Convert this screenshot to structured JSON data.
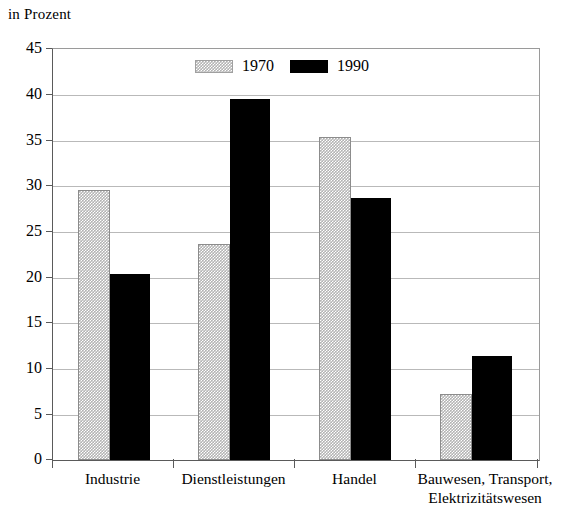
{
  "chart_data": {
    "type": "bar",
    "title": "in Prozent",
    "xlabel": "",
    "ylabel": "",
    "ylim": [
      0,
      45
    ],
    "yticks": [
      0,
      5,
      10,
      15,
      20,
      25,
      30,
      35,
      40,
      45
    ],
    "ytick_labels": [
      "0",
      "5",
      "10",
      "15",
      "20",
      "25",
      "30",
      "35",
      "40",
      "45"
    ],
    "grid": true,
    "legend_position": "top-center",
    "categories": [
      "Industrie",
      "Dienstleistungen",
      "Handel",
      "Bauwesen, Transport,\nElektrizitätswesen"
    ],
    "series": [
      {
        "name": "1970",
        "color": "#b3b3b3",
        "pattern": "checkerboard",
        "values": [
          29.6,
          23.7,
          35.4,
          7.2
        ]
      },
      {
        "name": "1990",
        "color": "#000000",
        "pattern": "solid",
        "values": [
          20.4,
          39.5,
          28.7,
          11.4
        ]
      }
    ]
  },
  "legend": {
    "entries": [
      {
        "label": "1970",
        "swatch": "hatched-gray-swatch"
      },
      {
        "label": "1990",
        "swatch": "solid-black-swatch"
      }
    ]
  }
}
